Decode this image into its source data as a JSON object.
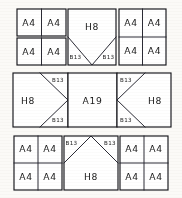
{
  "diagram": {
    "type": "floor-plan-grid",
    "stroke_color": "#15151a",
    "fill_color": "#ffffff",
    "background_color": "#fbfaf7",
    "rows": 3,
    "columns": 3,
    "labels": {
      "a4": "A4",
      "h8": "H8",
      "b13": "B13",
      "a19": "A19"
    },
    "blocks": [
      {
        "id": "top-left",
        "kind": "quad-grid",
        "cells": [
          "A4",
          "A4",
          "A4",
          "A4"
        ]
      },
      {
        "id": "top-center",
        "kind": "notched-v-down",
        "main": "H8",
        "corners": [
          "B13",
          "B13"
        ]
      },
      {
        "id": "top-right",
        "kind": "quad-grid",
        "cells": [
          "A4",
          "A4",
          "A4",
          "A4"
        ]
      },
      {
        "id": "middle-left",
        "kind": "arrow-right",
        "main": "H8",
        "corners": [
          "B13",
          "B13"
        ]
      },
      {
        "id": "middle-center",
        "kind": "plain",
        "main": "A19"
      },
      {
        "id": "middle-right",
        "kind": "arrow-left",
        "main": "H8",
        "corners": [
          "B13",
          "B13"
        ]
      },
      {
        "id": "bottom-left",
        "kind": "quad-grid",
        "cells": [
          "A4",
          "A4",
          "A4",
          "A4"
        ]
      },
      {
        "id": "bottom-center",
        "kind": "peak-up",
        "main": "H8",
        "corners": [
          "B13",
          "B13"
        ]
      },
      {
        "id": "bottom-right",
        "kind": "quad-grid",
        "cells": [
          "A4",
          "A4",
          "A4",
          "A4"
        ]
      }
    ]
  }
}
